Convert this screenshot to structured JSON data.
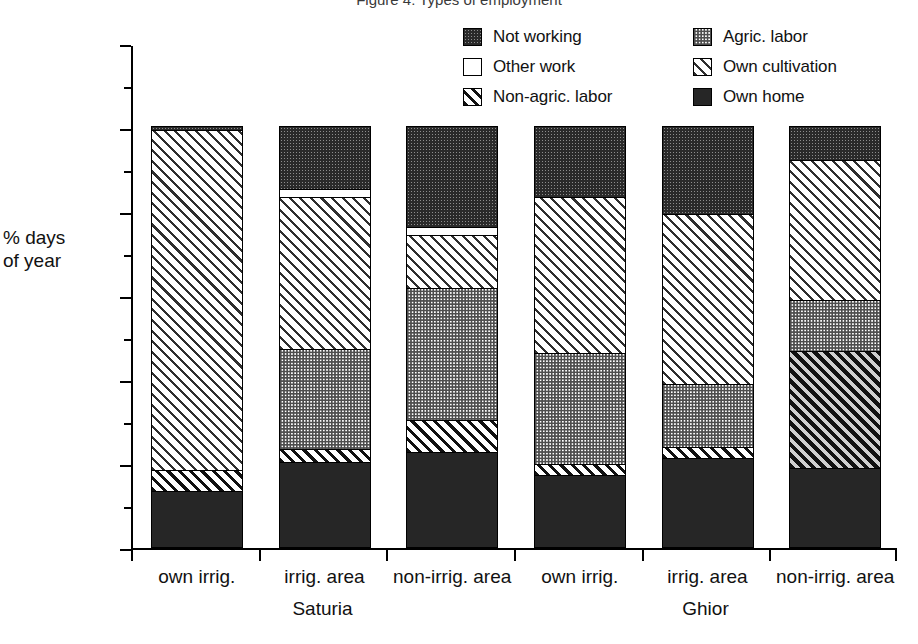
{
  "title": "Figure 4: Types of employment",
  "axis": {
    "y_title_line1": "% days",
    "y_title_line2": "of year",
    "y_ticks": [
      0,
      20,
      40,
      60,
      80,
      100,
      120
    ]
  },
  "legend": [
    {
      "label": "Not working",
      "pattern": "not-working"
    },
    {
      "label": "Agric. labor",
      "pattern": "agric-labor"
    },
    {
      "label": "Other work",
      "pattern": "other-work"
    },
    {
      "label": "Own cultivation",
      "pattern": "own-cultivation"
    },
    {
      "label": "Non-agric. labor",
      "pattern": "non-agric-labor"
    },
    {
      "label": "Own home",
      "pattern": "own-home"
    }
  ],
  "groups": [
    {
      "name": "Saturia",
      "bars": [
        0,
        1,
        2
      ]
    },
    {
      "name": "Ghior",
      "bars": [
        3,
        4,
        5
      ]
    }
  ],
  "chart_data": {
    "type": "bar",
    "subtype": "stacked-bar",
    "title": "Figure 4: Types of employment",
    "xlabel": "",
    "ylabel": "% days of year",
    "ylim": [
      0,
      120
    ],
    "yticks": [
      0,
      20,
      40,
      60,
      80,
      100,
      120
    ],
    "grid": false,
    "legend_position": "top-right",
    "categories": [
      "own irrig.",
      "irrig. area",
      "non-irrig. area",
      "own irrig.",
      "irrig. area",
      "non-irrig. area"
    ],
    "group_labels": [
      "Saturia",
      "Saturia",
      "Saturia",
      "Ghior",
      "Ghior",
      "Ghior"
    ],
    "stack_order_bottom_to_top": [
      "Own home",
      "Non-agric. labor",
      "Agric. labor",
      "Own cultivation",
      "Other work",
      "Not working"
    ],
    "series": [
      {
        "name": "Own home",
        "values": [
          13.0,
          20.0,
          22.5,
          17.0,
          21.0,
          18.5
        ]
      },
      {
        "name": "Non-agric. labor",
        "values": [
          5.0,
          3.0,
          7.5,
          2.5,
          2.5,
          28.0
        ]
      },
      {
        "name": "Agric. labor",
        "values": [
          0.0,
          24.0,
          31.5,
          26.5,
          15.0,
          12.0
        ]
      },
      {
        "name": "Own cultivation",
        "values": [
          81.0,
          36.0,
          12.5,
          37.0,
          40.5,
          33.5
        ]
      },
      {
        "name": "Other work",
        "values": [
          0.0,
          2.0,
          2.0,
          0.0,
          0.0,
          0.0
        ]
      },
      {
        "name": "Not working",
        "values": [
          1.0,
          15.0,
          24.0,
          17.0,
          21.0,
          8.0
        ]
      }
    ],
    "totals": [
      100,
      100,
      100,
      100,
      100,
      100
    ],
    "units": "% of days of year"
  },
  "bars": [
    {
      "label": "own irrig.",
      "group": "Saturia",
      "segments": [
        {
          "name": "Own home",
          "value": 13.0,
          "pattern": "own-home"
        },
        {
          "name": "Non-agric. labor",
          "value": 5.0,
          "pattern": "non-agric-labor"
        },
        {
          "name": "Own cultivation",
          "value": 81.0,
          "pattern": "own-cultivation"
        },
        {
          "name": "Not working",
          "value": 1.0,
          "pattern": "not-working"
        }
      ]
    },
    {
      "label": "irrig. area",
      "group": "Saturia",
      "segments": [
        {
          "name": "Own home",
          "value": 20.0,
          "pattern": "own-home"
        },
        {
          "name": "Non-agric. labor",
          "value": 3.0,
          "pattern": "non-agric-labor"
        },
        {
          "name": "Agric. labor",
          "value": 24.0,
          "pattern": "agric-labor"
        },
        {
          "name": "Own cultivation",
          "value": 36.0,
          "pattern": "own-cultivation"
        },
        {
          "name": "Other work",
          "value": 2.0,
          "pattern": "other-work"
        },
        {
          "name": "Not working",
          "value": 15.0,
          "pattern": "not-working"
        }
      ]
    },
    {
      "label": "non-irrig. area",
      "group": "Saturia",
      "segments": [
        {
          "name": "Own home",
          "value": 22.5,
          "pattern": "own-home"
        },
        {
          "name": "Non-agric. labor",
          "value": 7.5,
          "pattern": "non-agric-labor"
        },
        {
          "name": "Agric. labor",
          "value": 31.5,
          "pattern": "agric-labor"
        },
        {
          "name": "Own cultivation",
          "value": 12.5,
          "pattern": "own-cultivation"
        },
        {
          "name": "Other work",
          "value": 2.0,
          "pattern": "other-work"
        },
        {
          "name": "Not working",
          "value": 24.0,
          "pattern": "not-working"
        }
      ]
    },
    {
      "label": "own irrig.",
      "group": "Ghior",
      "segments": [
        {
          "name": "Own home",
          "value": 17.0,
          "pattern": "own-home"
        },
        {
          "name": "Non-agric. labor",
          "value": 2.5,
          "pattern": "non-agric-labor"
        },
        {
          "name": "Agric. labor",
          "value": 26.5,
          "pattern": "agric-labor"
        },
        {
          "name": "Own cultivation",
          "value": 37.0,
          "pattern": "own-cultivation"
        },
        {
          "name": "Not working",
          "value": 17.0,
          "pattern": "not-working"
        }
      ]
    },
    {
      "label": "irrig. area",
      "group": "Ghior",
      "segments": [
        {
          "name": "Own home",
          "value": 21.0,
          "pattern": "own-home"
        },
        {
          "name": "Non-agric. labor",
          "value": 2.5,
          "pattern": "non-agric-labor"
        },
        {
          "name": "Agric. labor",
          "value": 15.0,
          "pattern": "agric-labor"
        },
        {
          "name": "Own cultivation",
          "value": 40.5,
          "pattern": "own-cultivation"
        },
        {
          "name": "Not working",
          "value": 21.0,
          "pattern": "not-working"
        }
      ]
    },
    {
      "label": "non-irrig. area",
      "group": "Ghior",
      "segments": [
        {
          "name": "Own home",
          "value": 18.5,
          "pattern": "own-home"
        },
        {
          "name": "Non-agric. labor",
          "value": 28.0,
          "pattern": "non-agric-labor-dark"
        },
        {
          "name": "Agric. labor",
          "value": 12.0,
          "pattern": "agric-labor"
        },
        {
          "name": "Own cultivation",
          "value": 33.5,
          "pattern": "own-cultivation"
        },
        {
          "name": "Not working",
          "value": 8.0,
          "pattern": "not-working"
        }
      ]
    }
  ]
}
